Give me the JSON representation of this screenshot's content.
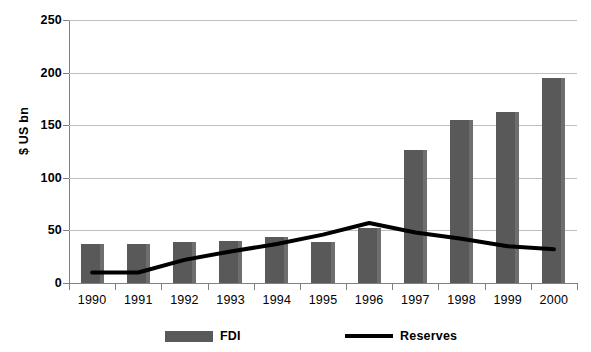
{
  "chart_data": {
    "type": "bar",
    "title": "",
    "xlabel": "",
    "ylabel": "$ US bn",
    "ylim": [
      0,
      250
    ],
    "yticks": [
      0,
      50,
      100,
      150,
      200,
      250
    ],
    "grid": true,
    "legend_position": "bottom",
    "categories": [
      "1990",
      "1991",
      "1992",
      "1993",
      "1994",
      "1995",
      "1996",
      "1997",
      "1998",
      "1999",
      "2000"
    ],
    "series": [
      {
        "name": "FDI",
        "type": "bar",
        "color": "#595959",
        "values": [
          37,
          37,
          39,
          40,
          44,
          39,
          52,
          126,
          155,
          163,
          195
        ]
      },
      {
        "name": "Reserves",
        "type": "line",
        "color": "#000000",
        "values": [
          10,
          10,
          22,
          30,
          37,
          46,
          57,
          48,
          42,
          35,
          32
        ]
      }
    ]
  },
  "legend": {
    "items": [
      {
        "label": "FDI",
        "marker": "bar-swatch-icon"
      },
      {
        "label": "Reserves",
        "marker": "line-swatch-icon"
      }
    ]
  }
}
